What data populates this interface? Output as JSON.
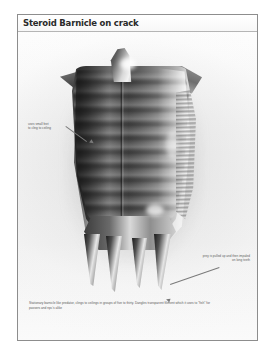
{
  "sheet": {
    "title": "Steroid Barnicle on crack",
    "caption": "Stationary barnicle like predator, clings to ceilings in groups of five to thirty.  Dangles transparent filiment which it uses to \"fish\" for passers and npc's alike"
  },
  "annotations": [
    {
      "id": "feet",
      "text": "uses small feet\nto cling to ceiling"
    },
    {
      "id": "teeth",
      "text": "prey is pulled up and then impaled\non long teeth"
    }
  ],
  "artwork": {
    "subject": "steroid-barnacle-creature",
    "parts": [
      "crest-spike",
      "left-shoulder-spike",
      "right-shoulder-spike",
      "segmented-carapace",
      "central-seam",
      "cilia-feet",
      "jaw-block",
      "fang-1",
      "fang-2",
      "fang-3",
      "fang-4"
    ],
    "palette": {
      "page": "#fbfbfb",
      "frame": "#8d8d8d",
      "title_text": "#2a2a2a",
      "body_dark": "#2e2e2e",
      "body_mid": "#6b6b6b",
      "body_light": "#e2e2e2",
      "annotation_text": "#5e5e5e"
    }
  }
}
